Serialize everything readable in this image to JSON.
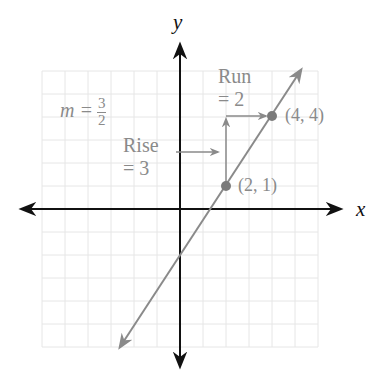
{
  "diagram": {
    "type": "slope-illustration",
    "axes": {
      "x_label": "x",
      "y_label": "y"
    },
    "slope_label": {
      "prefix": "m =",
      "numerator": "3",
      "denominator": "2"
    },
    "rise_label": {
      "line1": "Rise",
      "line2": "= 3"
    },
    "run_label": {
      "line1": "Run",
      "line2": "= 2"
    },
    "points": [
      {
        "label": "(2, 1)",
        "x": 2,
        "y": 1
      },
      {
        "label": "(4, 4)",
        "x": 4,
        "y": 4
      }
    ],
    "line": {
      "slope": 1.5,
      "intercept": -2,
      "equation_implied": "y = 1.5x - 2"
    },
    "grid": {
      "x_range": [
        -6,
        6
      ],
      "y_range": [
        -6,
        6
      ],
      "step": 1
    },
    "colors": {
      "axis": "#111111",
      "annotation": "#8a8a8a",
      "grid": "#e4e4e4",
      "point": "#7a7a7a"
    }
  }
}
